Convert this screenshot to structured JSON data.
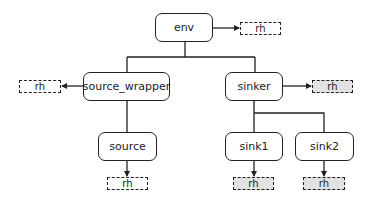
{
  "diagram": {
    "type": "tree",
    "colors": {
      "stroke": "#222222",
      "node_fill": "#ffffff",
      "rh_gray_fill": "#e2e2e2",
      "rh_white_fill": "#ffffff"
    },
    "nodes": {
      "env": {
        "label": "env"
      },
      "source_wrapper": {
        "label": "source_wrapper"
      },
      "sinker": {
        "label": "sinker"
      },
      "source": {
        "label": "source"
      },
      "sink1": {
        "label": "sink1"
      },
      "sink2": {
        "label": "sink2"
      }
    },
    "rh_boxes": {
      "env": {
        "label": "rh",
        "fill": "white"
      },
      "source_wrapper": {
        "label": "rh",
        "fill": "white"
      },
      "sinker": {
        "label": "rh",
        "fill": "gray"
      },
      "source": {
        "label": "rh",
        "fill": "white"
      },
      "sink1": {
        "label": "rh",
        "fill": "gray"
      },
      "sink2": {
        "label": "rh",
        "fill": "gray"
      }
    },
    "edges": [
      {
        "from": "env",
        "to": "source_wrapper",
        "type": "tree"
      },
      {
        "from": "env",
        "to": "sinker",
        "type": "tree"
      },
      {
        "from": "source_wrapper",
        "to": "source",
        "type": "tree"
      },
      {
        "from": "sinker",
        "to": "sink1",
        "type": "tree"
      },
      {
        "from": "sinker",
        "to": "sink2",
        "type": "tree"
      },
      {
        "from": "env",
        "to": "rh",
        "type": "arrow"
      },
      {
        "from": "source_wrapper",
        "to": "rh",
        "type": "arrow"
      },
      {
        "from": "sinker",
        "to": "rh",
        "type": "arrow"
      },
      {
        "from": "source",
        "to": "rh",
        "type": "arrow"
      },
      {
        "from": "sink1",
        "to": "rh",
        "type": "arrow"
      },
      {
        "from": "sink2",
        "to": "rh",
        "type": "arrow"
      }
    ]
  }
}
